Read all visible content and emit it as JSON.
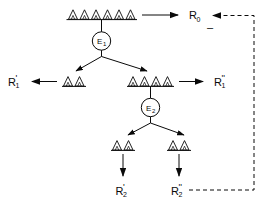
{
  "diagram": {
    "background_color": "#ffffff",
    "line_color": "#0a0a0a",
    "levels": [
      {
        "id": "level-0",
        "group": {
          "name": "root-triangle-group",
          "triangle_count": 6,
          "has_baseline": true
        },
        "output_label": "R",
        "output_sub": "0",
        "output_prime": ""
      },
      {
        "id": "level-1",
        "left_group": {
          "name": "left-triangle-group",
          "triangle_count": 2,
          "has_baseline": true
        },
        "right_group": {
          "name": "right-triangle-group",
          "triangle_count": 4,
          "has_baseline": true
        },
        "left_label": "R",
        "left_sub": "1",
        "left_prime": "'",
        "right_label": "R",
        "right_sub": "1",
        "right_prime": "''"
      },
      {
        "id": "level-2",
        "left_group": {
          "name": "bottom-left-triangle-group",
          "triangle_count": 2,
          "has_baseline": true
        },
        "right_group": {
          "name": "bottom-right-triangle-group",
          "triangle_count": 2,
          "has_baseline": true
        },
        "left_label": "R",
        "left_sub": "2",
        "left_prime": "'",
        "right_label": "R",
        "right_sub": "2",
        "right_prime": "''"
      }
    ],
    "nodes": [
      {
        "id": "node-e1",
        "label": "E",
        "sub": "1"
      },
      {
        "id": "node-e2",
        "label": "E",
        "sub": "2"
      }
    ],
    "feedback": {
      "name": "feedback-path",
      "style": "dashed",
      "sign_label": "–",
      "from": "R2''",
      "to": "R0"
    }
  }
}
